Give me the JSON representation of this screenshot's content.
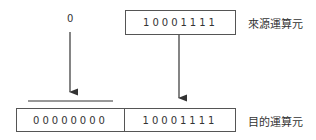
{
  "diagram": {
    "input_constant": "0",
    "source": {
      "bits": "10001111",
      "label": "來源運算元"
    },
    "destination": {
      "high_bits": "00000000",
      "low_bits": "10001111",
      "label": "目的運算元"
    }
  }
}
